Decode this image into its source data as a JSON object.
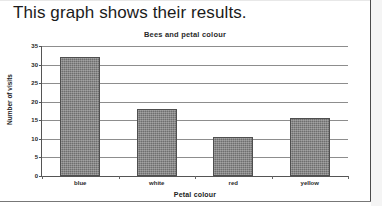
{
  "document": {
    "heading": "This graph shows their results."
  },
  "chart_data": {
    "type": "bar",
    "title": "Bees and petal colour",
    "xlabel": "Petal colour",
    "ylabel": "Number of visits",
    "categories": [
      "blue",
      "white",
      "red",
      "yellow"
    ],
    "values": [
      32,
      18,
      10.5,
      15.5
    ],
    "ylim": [
      0,
      35
    ],
    "ytick_labels": [
      "0",
      "5",
      "10",
      "15",
      "20",
      "25",
      "30",
      "35"
    ],
    "ytick_values": [
      0,
      5,
      10,
      15,
      20,
      25,
      30,
      35
    ],
    "grid": true,
    "legend": false,
    "bar_color": "#6e6e6e",
    "axis_color": "#555555",
    "gridline_color": "#8d8d8d"
  }
}
